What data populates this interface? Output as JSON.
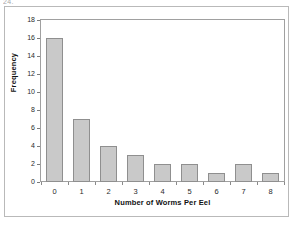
{
  "artifact": {
    "top_left_text": "24."
  },
  "chart_data": {
    "type": "bar",
    "title": "",
    "xlabel": "Number of Worms Per Eel",
    "ylabel": "Frequency",
    "categories": [
      "0",
      "1",
      "2",
      "3",
      "4",
      "5",
      "6",
      "7",
      "8"
    ],
    "values": [
      16,
      7,
      4,
      3,
      2,
      2,
      1,
      2,
      1
    ],
    "ylim": [
      0,
      18
    ],
    "yticks": [
      "0",
      "2",
      "4",
      "6",
      "8",
      "10",
      "12",
      "14",
      "16",
      "18"
    ],
    "ytick_values": [
      0,
      2,
      4,
      6,
      8,
      10,
      12,
      14,
      16,
      18
    ],
    "grid": false,
    "legend": false,
    "bar_fill_color": "#c9c9c9",
    "bar_border_color": "#8f8f8f",
    "axis_color": "#a0a0a0",
    "text_color": "#111111"
  }
}
